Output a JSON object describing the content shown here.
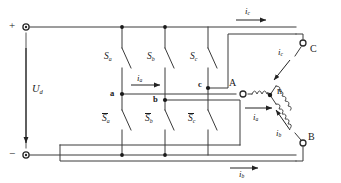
{
  "diagram": {
    "type": "circuit-schematic",
    "colors": {
      "wire": "#3a3a3a",
      "text": "#1a1a1a",
      "background": "#ffffff"
    }
  },
  "source": {
    "positive_sign": "+",
    "negative_sign": "−",
    "voltage_label": "U",
    "voltage_subscript": "d"
  },
  "switches": {
    "upper": [
      {
        "label": "S",
        "subscript": "a",
        "name": "switch-sa"
      },
      {
        "label": "S",
        "subscript": "b",
        "name": "switch-sb"
      },
      {
        "label": "S",
        "subscript": "c",
        "name": "switch-sc"
      }
    ],
    "lower": [
      {
        "label": "S",
        "subscript": "a",
        "name": "switch-sa-bar"
      },
      {
        "label": "S",
        "subscript": "b",
        "name": "switch-sb-bar"
      },
      {
        "label": "S",
        "subscript": "c",
        "name": "switch-sc-bar"
      }
    ]
  },
  "midpoints": [
    {
      "label": "a",
      "name": "node-a"
    },
    {
      "label": "b",
      "name": "node-b"
    },
    {
      "label": "c",
      "name": "node-c"
    }
  ],
  "load": {
    "neutral_label": "n",
    "terminals": [
      {
        "label": "A",
        "name": "terminal-a"
      },
      {
        "label": "B",
        "name": "terminal-b"
      },
      {
        "label": "C",
        "name": "terminal-c"
      }
    ]
  },
  "currents": [
    {
      "label": "i",
      "subscript": "a",
      "name": "current-ia-bridge",
      "location": "bridge-phase-a"
    },
    {
      "label": "i",
      "subscript": "c",
      "name": "current-ic-top",
      "location": "top-rail-to-C"
    },
    {
      "label": "i",
      "subscript": "a",
      "name": "current-ia-load",
      "location": "load-phase-a"
    },
    {
      "label": "i",
      "subscript": "b",
      "name": "current-ib-bottom",
      "location": "bottom-rail-to-B"
    },
    {
      "label": "i",
      "subscript": "c",
      "name": "current-ic-winding",
      "location": "winding-C"
    },
    {
      "label": "i",
      "subscript": "b",
      "name": "current-ib-winding",
      "location": "winding-B"
    }
  ]
}
